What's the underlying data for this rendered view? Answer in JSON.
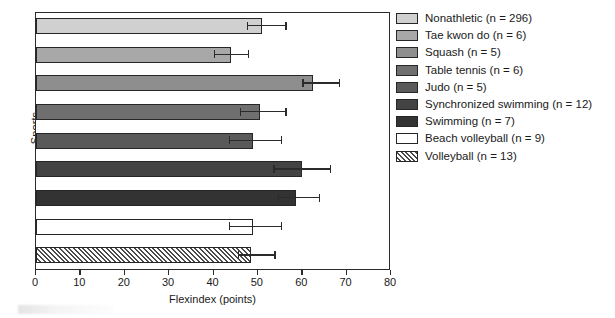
{
  "chart_data": {
    "type": "bar",
    "orientation": "horizontal",
    "title": "",
    "xlabel": "Flexindex (points)",
    "ylabel": "Sports",
    "xlim": [
      0,
      80
    ],
    "xticks": [
      0,
      10,
      20,
      30,
      40,
      50,
      60,
      70,
      80
    ],
    "grid": false,
    "legend_position": "right",
    "categories": [
      "Nonathletic (n = 296)",
      "Tae kwon do (n = 6)",
      "Squash (n = 5)",
      "Table tennis (n = 6)",
      "Judo (n = 5)",
      "Synchronized swimming (n = 12)",
      "Swimming (n = 7)",
      "Beach volleyball (n = 9)",
      "Volleyball (n = 13)"
    ],
    "values": [
      51.0,
      44.0,
      62.5,
      50.5,
      49.0,
      60.0,
      58.5,
      49.0,
      48.5
    ],
    "error_low": [
      47.5,
      40.0,
      60.0,
      46.0,
      43.5,
      53.5,
      54.5,
      43.5,
      45.5
    ],
    "error_high": [
      56.5,
      48.0,
      68.5,
      56.5,
      55.5,
      66.5,
      64.0,
      55.5,
      54.0
    ],
    "bar_colors": [
      "#d0d0d0",
      "#a8a8a8",
      "#8e8e8e",
      "#6f6f6f",
      "#5a5a5a",
      "#434343",
      "#333333",
      "#ffffff",
      "hatched"
    ],
    "bar_fill_names": [
      "light-gray",
      "gray",
      "medium-gray",
      "dark-gray",
      "darker-gray",
      "very-dark-gray",
      "near-black",
      "white",
      "diagonal-hatch"
    ]
  },
  "legend": {
    "items": [
      {
        "label": "Nonathletic (n = 296)",
        "color": "#d0d0d0",
        "pattern": "solid"
      },
      {
        "label": "Tae kwon do (n = 6)",
        "color": "#a8a8a8",
        "pattern": "solid"
      },
      {
        "label": "Squash (n = 5)",
        "color": "#8e8e8e",
        "pattern": "solid"
      },
      {
        "label": "Table tennis (n = 6)",
        "color": "#6f6f6f",
        "pattern": "solid"
      },
      {
        "label": "Judo (n = 5)",
        "color": "#5a5a5a",
        "pattern": "solid"
      },
      {
        "label": "Synchronized swimming (n = 12)",
        "color": "#434343",
        "pattern": "solid"
      },
      {
        "label": "Swimming (n = 7)",
        "color": "#333333",
        "pattern": "solid"
      },
      {
        "label": "Beach volleyball (n = 9)",
        "color": "#ffffff",
        "pattern": "solid"
      },
      {
        "label": "Volleyball (n = 13)",
        "color": "#ffffff",
        "pattern": "hatched"
      }
    ]
  },
  "axes": {
    "x_title": "Flexindex (points)",
    "y_title": "Sports",
    "x_tick_labels": [
      "0",
      "10",
      "20",
      "30",
      "40",
      "50",
      "60",
      "70",
      "80"
    ]
  },
  "colors": {
    "axis": "#2b2b2b",
    "background": "#ffffff",
    "text": "#1a1a1a"
  }
}
